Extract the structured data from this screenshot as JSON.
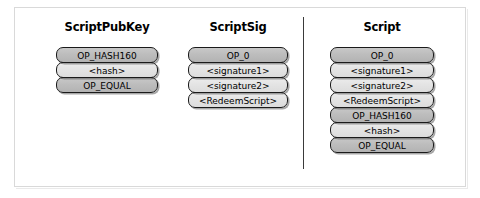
{
  "figure": {
    "title_row": [
      "ScriptPubKey",
      "ScriptSig",
      "Script"
    ],
    "divider": "vertical-rule"
  },
  "columns": [
    {
      "id": "scriptpubkey",
      "title": "ScriptPubKey",
      "items": [
        {
          "label": "OP_HASH160",
          "kind": "opcode",
          "shade": "dark"
        },
        {
          "label": "<hash>",
          "kind": "data",
          "shade": "light"
        },
        {
          "label": "OP_EQUAL",
          "kind": "opcode",
          "shade": "dark"
        }
      ]
    },
    {
      "id": "scriptsig",
      "title": "ScriptSig",
      "items": [
        {
          "label": "OP_0",
          "kind": "opcode",
          "shade": "dark"
        },
        {
          "label": "<signature1>",
          "kind": "data",
          "shade": "light"
        },
        {
          "label": "<signature2>",
          "kind": "data",
          "shade": "light"
        },
        {
          "label": "<RedeemScript>",
          "kind": "data",
          "shade": "light"
        }
      ]
    },
    {
      "id": "script",
      "title": "Script",
      "items": [
        {
          "label": "OP_0",
          "kind": "opcode",
          "shade": "dark"
        },
        {
          "label": "<signature1>",
          "kind": "data",
          "shade": "light"
        },
        {
          "label": "<signature2>",
          "kind": "data",
          "shade": "light"
        },
        {
          "label": "<RedeemScript>",
          "kind": "data",
          "shade": "light"
        },
        {
          "label": "OP_HASH160",
          "kind": "opcode",
          "shade": "dark"
        },
        {
          "label": "<hash>",
          "kind": "data",
          "shade": "light"
        },
        {
          "label": "OP_EQUAL",
          "kind": "opcode",
          "shade": "dark"
        }
      ]
    }
  ],
  "colors": {
    "box_border": "#1a1a1a",
    "box_dark_fill": "#bdbdbd",
    "box_light_fill": "#e4e4e4",
    "frame_border": "#d9d9d9",
    "divider": "#3a3a3a",
    "background": "#ffffff",
    "text": "#000000"
  }
}
